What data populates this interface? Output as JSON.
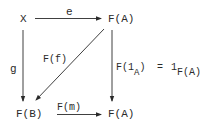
{
  "diagram": {
    "type": "commutative-diagram",
    "nodes": {
      "top_left": "X",
      "top_right": "F(A)",
      "bottom_left": "F(B)",
      "bottom_right": "F(A)"
    },
    "arrows": {
      "top": {
        "label": "e",
        "from": "X",
        "to": "F(A)"
      },
      "left": {
        "label": "g",
        "from": "X",
        "to": "F(B)"
      },
      "diagonal": {
        "label": "F(f)",
        "from": "F(A)",
        "to": "F(B)"
      },
      "right": {
        "label_main": "F(1",
        "label_sub": "A",
        "label_close": ")",
        "eq": "=",
        "rhs_main": "1",
        "rhs_sub": "F(A)",
        "from": "F(A)",
        "to": "F(A)"
      },
      "bottom": {
        "label": "F(m)",
        "from": "F(B)",
        "to": "F(A)"
      }
    },
    "colors": {
      "ink": "#2a2a2a",
      "background": "#ffffff"
    }
  }
}
